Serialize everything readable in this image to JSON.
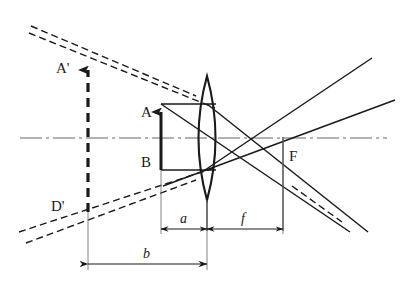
{
  "figure": {
    "kind": "optics-ray-diagram",
    "title": "",
    "background_color": "#ffffff",
    "ink_color": "#1a1a1a",
    "axis_color": "#555555",
    "width": 404,
    "height": 290
  },
  "labels": {
    "image_point": "A'",
    "object_point_top": "A",
    "object_point_bottom": "B",
    "image_point_bottom": "D'",
    "focal_point": "F",
    "object_distance": "a",
    "focal_length": "f",
    "image_distance": "b"
  },
  "geometry": {
    "optical_axis": {
      "y": 138,
      "x_start": 20,
      "x_end": 387
    },
    "lens": {
      "center_x": 207,
      "top_y": 76,
      "bottom_y": 200,
      "half_width": 17
    },
    "object_arrow": {
      "x": 161,
      "base_y": 170,
      "tip_y": 104
    },
    "image_arrow": {
      "x": 88,
      "base_y": 212,
      "tip_y": 62
    },
    "focal_point": {
      "x": 283,
      "y": 137
    },
    "dim_af_line_y": 229,
    "dim_b_line_y": 264
  },
  "label_positions": {
    "image_point": {
      "x": 56,
      "y": 73
    },
    "object_point_top": {
      "x": 141,
      "y": 117
    },
    "object_point_bottom": {
      "x": 141,
      "y": 167
    },
    "image_point_bottom": {
      "x": 53,
      "y": 211
    },
    "focal_point": {
      "x": 289,
      "y": 161
    },
    "object_distance": {
      "x": 180,
      "y": 224
    },
    "focal_length": {
      "x": 242,
      "y": 224
    },
    "image_distance": {
      "x": 143,
      "y": 259
    }
  },
  "icons": {
    "arrowhead": "arrowhead-icon",
    "lens": "biconvex-lens-icon"
  }
}
